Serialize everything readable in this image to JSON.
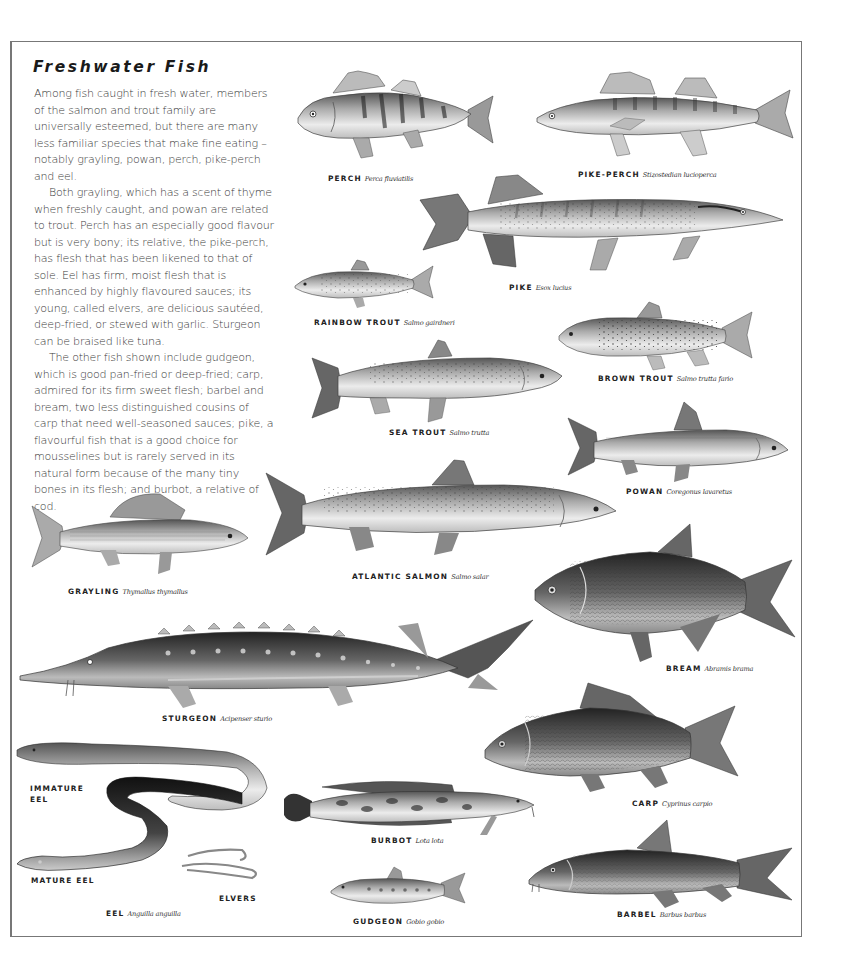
{
  "page": {
    "title": "Freshwater Fish",
    "paragraphs": [
      "Among fish caught in fresh water, members of the salmon and trout family are universally esteemed, but there are many less familiar species that make fine eating – notably grayling, powan, perch, pike-perch and eel.",
      "Both grayling, which has a scent of thyme when freshly caught, and powan are related to trout. Perch has an especially good flavour but is very bony; its relative, the pike-perch, has flesh that has been likened to that of sole. Eel has firm, moist flesh that is enhanced by highly flavoured sauces; its young, called elvers, are delicious sautéed, deep-fried, or stewed with garlic. Sturgeon can be braised like tuna.",
      "The other fish shown include gudgeon, which is good pan-fried or deep-fried; carp, admired for its firm sweet flesh; barbel and bream, two less distinguished cousins of carp that need well-seasoned sauces; pike, a flavourful fish that is a good choice for mousselines but is rarely served in its natural form because of the many tiny bones in its flesh; and burbot, a relative of cod."
    ]
  },
  "fish": {
    "perch": {
      "common": "PERCH",
      "latin": "Perca fluviatilis"
    },
    "pike_perch": {
      "common": "PIKE-PERCH",
      "latin": "Stizostedian lucioperca"
    },
    "pike": {
      "common": "PIKE",
      "latin": "Esox lucius"
    },
    "rainbow_trout": {
      "common": "RAINBOW TROUT",
      "latin": "Salmo gairdneri"
    },
    "brown_trout": {
      "common": "BROWN TROUT",
      "latin": "Salmo trutta fario"
    },
    "sea_trout": {
      "common": "SEA TROUT",
      "latin": "Salmo trutta"
    },
    "powan": {
      "common": "POWAN",
      "latin": "Coregonus lavaretus"
    },
    "grayling": {
      "common": "GRAYLING",
      "latin": "Thymallus thymallus"
    },
    "atlantic_salmon": {
      "common": "ATLANTIC SALMON",
      "latin": "Salmo salar"
    },
    "bream": {
      "common": "BREAM",
      "latin": "Abramis brama"
    },
    "sturgeon": {
      "common": "STURGEON",
      "latin": "Acipenser sturio"
    },
    "carp": {
      "common": "CARP",
      "latin": "Cyprinus carpio"
    },
    "burbot": {
      "common": "BURBOT",
      "latin": "Lota lota"
    },
    "gudgeon": {
      "common": "GUDGEON",
      "latin": "Gobio gobio"
    },
    "barbel": {
      "common": "BARBEL",
      "latin": "Barbus barbus"
    },
    "eel": {
      "common": "EEL",
      "latin": "Anguilla anguilla",
      "immature_line1": "IMMATURE",
      "immature_line2": "EEL",
      "mature": "MATURE EEL",
      "elvers": "ELVERS"
    }
  },
  "colors": {
    "frame": "#777777",
    "text": "#2a2a2a",
    "fish_light": "#e8e8e8",
    "fish_mid": "#9a9a9a",
    "fish_dark": "#3a3a3a"
  }
}
